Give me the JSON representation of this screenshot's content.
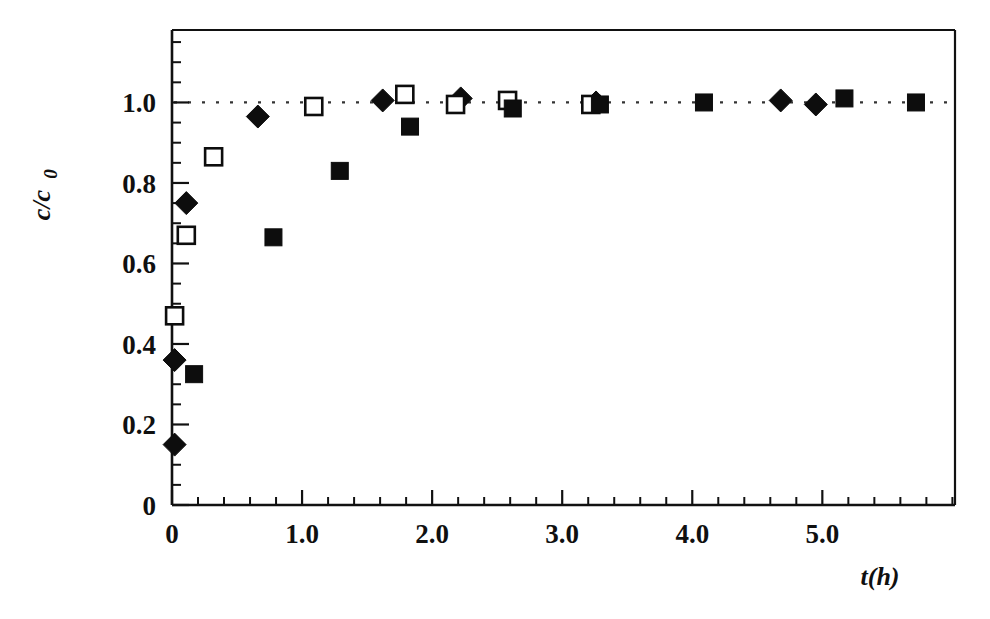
{
  "chart_data": {
    "type": "scatter",
    "title": "",
    "xlabel": "t(h)",
    "ylabel": "c/c_0",
    "ylabel_parts": {
      "main": "c/c",
      "sub": "0"
    },
    "xlim": [
      0,
      6.02
    ],
    "ylim": [
      0,
      1.18
    ],
    "grid": false,
    "legend": "none",
    "x_ticks_major": [
      0,
      1.0,
      2.0,
      3.0,
      4.0,
      5.0
    ],
    "x_tick_labels": [
      "0",
      "1.0",
      "2.0",
      "3.0",
      "4.0",
      "5.0"
    ],
    "x_minor_per_major": 5,
    "x_minor_step": 0.2,
    "y_ticks_major": [
      0,
      0.2,
      0.4,
      0.6,
      0.8,
      1.0
    ],
    "y_tick_labels": [
      "0",
      "0.2",
      "0.4",
      "0.6",
      "0.8",
      "1.0"
    ],
    "y_minor_step": 0.05,
    "reference_line": {
      "y": 1.0,
      "style": "dotted",
      "color": "#333333"
    },
    "series": [
      {
        "name": "filled-diamond-series",
        "marker": "filled-diamond",
        "color": "#0d0d0d",
        "points": [
          {
            "x": 0.02,
            "y": 0.15
          },
          {
            "x": 0.02,
            "y": 0.36
          },
          {
            "x": 0.11,
            "y": 0.75
          },
          {
            "x": 0.66,
            "y": 0.965
          },
          {
            "x": 1.62,
            "y": 1.005
          },
          {
            "x": 2.22,
            "y": 1.01
          },
          {
            "x": 3.26,
            "y": 1.0
          },
          {
            "x": 4.68,
            "y": 1.005
          },
          {
            "x": 4.95,
            "y": 0.995
          }
        ]
      },
      {
        "name": "open-square-series",
        "marker": "open-square",
        "color": "#0d0d0d",
        "points": [
          {
            "x": 0.02,
            "y": 0.47
          },
          {
            "x": 0.11,
            "y": 0.67
          },
          {
            "x": 0.32,
            "y": 0.865
          },
          {
            "x": 1.09,
            "y": 0.99
          },
          {
            "x": 1.79,
            "y": 1.02
          },
          {
            "x": 2.18,
            "y": 0.995
          },
          {
            "x": 2.58,
            "y": 1.005
          },
          {
            "x": 3.22,
            "y": 0.995
          }
        ]
      },
      {
        "name": "filled-square-series",
        "marker": "filled-square",
        "color": "#0d0d0d",
        "points": [
          {
            "x": 0.17,
            "y": 0.325
          },
          {
            "x": 0.78,
            "y": 0.665
          },
          {
            "x": 1.29,
            "y": 0.83
          },
          {
            "x": 1.83,
            "y": 0.94
          },
          {
            "x": 2.62,
            "y": 0.985
          },
          {
            "x": 3.29,
            "y": 0.995
          },
          {
            "x": 4.09,
            "y": 1.0
          },
          {
            "x": 5.17,
            "y": 1.01
          },
          {
            "x": 5.72,
            "y": 1.0
          }
        ]
      }
    ]
  }
}
